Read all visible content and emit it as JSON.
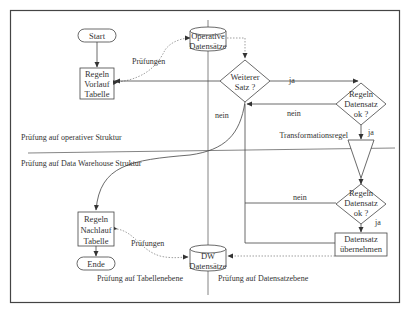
{
  "colors": {
    "line": "#555555",
    "frame": "#444444",
    "text": "#333333",
    "background": "#ffffff"
  },
  "nodes": {
    "start": "Start",
    "vorlauf": [
      "Regeln",
      "Vorlauf",
      "Tabelle"
    ],
    "operative_db": [
      "Operative",
      "Datensätze"
    ],
    "weiterer_satz": [
      "Weiterer",
      "Satz ?"
    ],
    "regeln_ok_1": [
      "Regeln",
      "Datensatz",
      "ok ?"
    ],
    "transformation": "Transformationsregel",
    "regeln_ok_2": [
      "Regeln",
      "Datensatz",
      "ok ?"
    ],
    "uebernehmen": [
      "Datensatz",
      "übernehmen"
    ],
    "dw_db": [
      "DW",
      "Datensätze"
    ],
    "nachlauf": [
      "Regeln",
      "Nachlauf",
      "Tabelle"
    ],
    "ende": "Ende"
  },
  "labels": {
    "pruefungen_top": "Prüfungen",
    "pruefungen_bottom": "Prüfungen",
    "ja_1": "ja",
    "nein_1": "nein",
    "nein_left": "nein",
    "ja_2": "ja",
    "nein_2": "nein",
    "ja_3": "ja",
    "operative_struktur": "Prüfung auf operativer Struktur",
    "dw_struktur": "Prüfung auf Data Warehouse Struktur",
    "tabellenebene": "Prüfung auf Tabellenebene",
    "datensatzebene": "Prüfung auf Datensatzebene"
  }
}
